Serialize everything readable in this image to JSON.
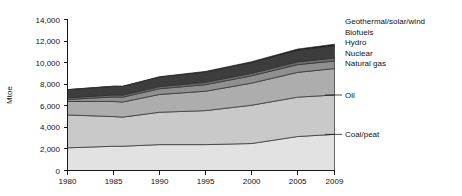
{
  "chart_data": {
    "type": "area",
    "title": "",
    "xlabel": "",
    "ylabel": "Mtoe",
    "xlim": [
      1980,
      2009
    ],
    "ylim": [
      0,
      14000
    ],
    "grid": false,
    "stacked": true,
    "legend_position": "right",
    "x": [
      1980,
      1985,
      1986,
      1990,
      1995,
      2000,
      2005,
      2009
    ],
    "xtick_labels": [
      "1980",
      "1985",
      "1990",
      "1995",
      "2000",
      "2005",
      "2009"
    ],
    "xticks": [
      1980,
      1985,
      1990,
      1995,
      2000,
      2005,
      2009
    ],
    "ytick_labels": [
      "0",
      "2,000",
      "4,000",
      "6,000",
      "8,000",
      "10,000",
      "12,000",
      "14,000"
    ],
    "yticks": [
      0,
      2000,
      4000,
      6000,
      8000,
      10000,
      12000,
      14000
    ],
    "series": [
      {
        "name": "Coal/peat",
        "color": "#e2e2e2",
        "values": [
          2100,
          2250,
          2250,
          2400,
          2400,
          2500,
          3150,
          3350
        ]
      },
      {
        "name": "Oil",
        "color": "#c9c9c9",
        "values": [
          3050,
          2750,
          2700,
          3000,
          3150,
          3550,
          3650,
          3650
        ]
      },
      {
        "name": "Natural gas",
        "color": "#adadad",
        "values": [
          1250,
          1400,
          1400,
          1650,
          1800,
          2050,
          2300,
          2450
        ]
      },
      {
        "name": "Nuclear",
        "color": "#8f8f8f",
        "values": [
          190,
          420,
          450,
          530,
          610,
          680,
          720,
          700
        ]
      },
      {
        "name": "Hydro",
        "color": "#6e6e6e",
        "values": [
          150,
          180,
          185,
          195,
          220,
          230,
          250,
          280
        ]
      },
      {
        "name": "Biofuels",
        "color": "#3d3d3d",
        "values": [
          750,
          800,
          810,
          880,
          950,
          1000,
          1080,
          1130
        ]
      },
      {
        "name": "Geothermal/solar/wind",
        "color": "#151515",
        "values": [
          10,
          20,
          25,
          40,
          60,
          80,
          110,
          150
        ]
      }
    ],
    "legend_entries": [
      {
        "label": "Geothermal/solar/wind"
      },
      {
        "label": "Biofuels"
      },
      {
        "label": "Hydro"
      },
      {
        "label": "Nuclear"
      },
      {
        "label": "Natural gas"
      }
    ],
    "callout_labels": [
      {
        "label": "Oil"
      },
      {
        "label": "Coal/peat"
      }
    ]
  }
}
